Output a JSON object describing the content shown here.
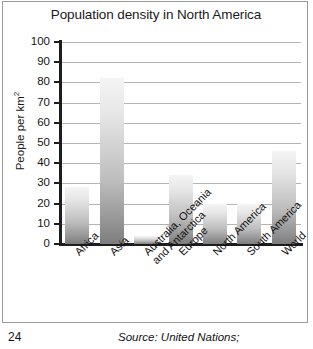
{
  "chart_data": {
    "type": "bar",
    "title": "Population density in North America",
    "xlabel": "",
    "ylabel": "People per km2",
    "ylabel_base": "People per km",
    "ylabel_sup": "2",
    "categories": [
      "Africa",
      "Asia",
      "Australia, Oceania\nand Antarctica",
      "Europe",
      "North America",
      "South America",
      "World"
    ],
    "category_lines": [
      [
        "Africa"
      ],
      [
        "Asia"
      ],
      [
        "Australia, Oceania",
        "and Antarctica"
      ],
      [
        "Europe"
      ],
      [
        "North America"
      ],
      [
        "South America"
      ],
      [
        "World"
      ]
    ],
    "values": [
      28,
      82,
      4,
      34,
      20,
      20,
      46
    ],
    "ylim": [
      0,
      100
    ],
    "yticks": [
      0,
      10,
      20,
      30,
      40,
      50,
      60,
      70,
      80,
      90,
      100
    ],
    "ytick_labels": [
      "0",
      "10",
      "20",
      "30",
      "40",
      "50",
      "60",
      "70",
      "80",
      "90",
      "100"
    ],
    "grid": true,
    "legend": "none",
    "bar_fill_light": "#f4f4f4",
    "bar_fill_dark": "#7c7c7c",
    "gridline_color": "#b4b4b4",
    "axis_color": "#1d1d1d",
    "frame_color": "#9a9a9a"
  },
  "footer": {
    "page_number": "24",
    "source": "Source: United Nations;"
  }
}
